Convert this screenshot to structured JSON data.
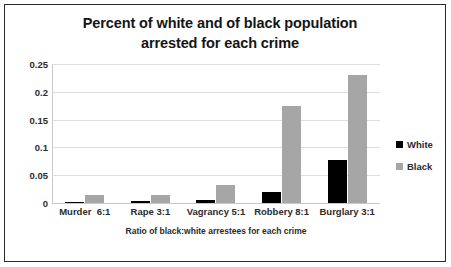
{
  "chart_data": {
    "type": "bar",
    "title": "Percent of white and of black population arrested for each crime",
    "title_line1": "Percent of white and of black population",
    "title_line2": "arrested for each crime",
    "xlabel": "Ratio of black:white arrestees for each crime",
    "ylabel": "",
    "categories": [
      "Murder  6:1",
      "Rape 3:1",
      "Vagrancy 5:1",
      "Robbery 8:1",
      "Burglary 3:1"
    ],
    "series": [
      {
        "name": "White",
        "color": "#000000",
        "values": [
          0.002,
          0.004,
          0.005,
          0.02,
          0.078
        ]
      },
      {
        "name": "Black",
        "color": "#a6a6a6",
        "values": [
          0.014,
          0.015,
          0.033,
          0.174,
          0.231
        ]
      }
    ],
    "ylim": [
      0,
      0.25
    ],
    "yticks": [
      0,
      0.05,
      0.1,
      0.15,
      0.2,
      0.25
    ],
    "ytick_labels": [
      "0",
      "0.05",
      "0.1",
      "0.15",
      "0.2",
      "0.25"
    ],
    "grid": true,
    "legend_position": "right",
    "legend": [
      "White",
      "Black"
    ],
    "border_color": "#2b2b2b",
    "gridline_color": "#dedede",
    "plot_background": "#ffffff"
  }
}
